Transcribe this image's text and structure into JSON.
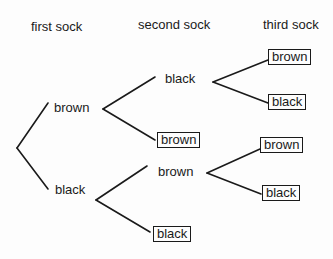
{
  "headers": {
    "first": "first sock",
    "second": "second sock",
    "third": "third sock"
  },
  "tree": {
    "first": [
      {
        "label": "brown",
        "second": [
          {
            "label": "black",
            "third": [
              {
                "label": "brown",
                "boxed": true
              },
              {
                "label": "black",
                "boxed": true
              }
            ]
          },
          {
            "label": "brown",
            "boxed": true
          }
        ]
      },
      {
        "label": "black",
        "second": [
          {
            "label": "brown",
            "third": [
              {
                "label": "brown",
                "boxed": true
              },
              {
                "label": "black",
                "boxed": true
              }
            ]
          },
          {
            "label": "black",
            "boxed": true
          }
        ]
      }
    ]
  },
  "colors": {
    "ink": "#1a1a1a",
    "background": "#fdfdfd"
  }
}
